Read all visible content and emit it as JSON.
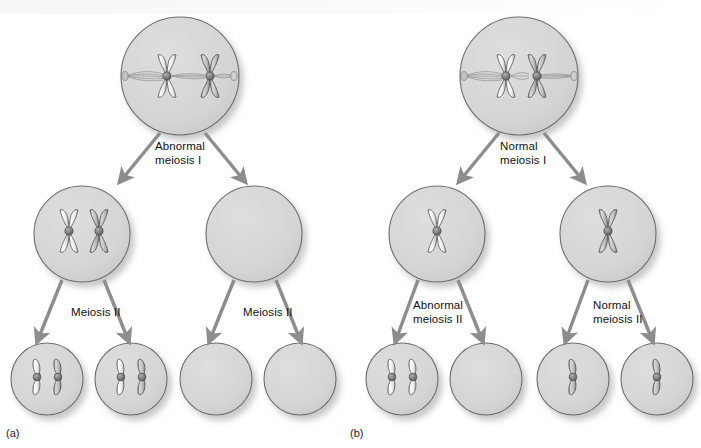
{
  "figure": {
    "title_visible": false,
    "background_color": "#ffffff",
    "cell_fill": "#d6d6d6",
    "cell_stroke": "#6e6e6e",
    "arrow_color": "#8d8d8d",
    "chromosome_light": "#f2f2f2",
    "chromosome_dark": "#bcbcbc",
    "centromere_color": "#7a7a7a",
    "label_color": "#111111"
  },
  "panels": [
    {
      "id": "a",
      "label": "(a)",
      "label_pos": {
        "x": 6,
        "y": 429
      },
      "parent_cell": {
        "name": "primary-cell-a",
        "cx": 180,
        "cy": 76,
        "r": 59,
        "chromosomes": 2,
        "chromosome_type": "replicated-pair-aligned",
        "spindle": true,
        "note_visible_text": ""
      },
      "stage1_label": {
        "text": "Abnormal\nmeiosis I",
        "line1": "Abnormal",
        "line2": "meiosis I",
        "x": 156,
        "y": 136
      },
      "secondary_cells": [
        {
          "name": "secondary-cell-a-left",
          "cx": 82,
          "cy": 234,
          "r": 48,
          "chromosomes": 2,
          "chromosome_type": "replicated"
        },
        {
          "name": "secondary-cell-a-right",
          "cx": 254,
          "cy": 234,
          "r": 48,
          "chromosomes": 0,
          "chromosome_type": "none"
        }
      ],
      "stage2_labels": [
        {
          "text": "Meiosis II",
          "x": 72,
          "y": 305
        },
        {
          "text": "Meiosis II",
          "x": 243,
          "y": 305
        }
      ],
      "gametes": [
        {
          "name": "gamete-a-1",
          "cx": 47,
          "cy": 379,
          "r": 36,
          "chromosomes": 2,
          "chromosome_type": "single"
        },
        {
          "name": "gamete-a-2",
          "cx": 131,
          "cy": 379,
          "r": 36,
          "chromosomes": 2,
          "chromosome_type": "single"
        },
        {
          "name": "gamete-a-3",
          "cx": 216,
          "cy": 379,
          "r": 36,
          "chromosomes": 0,
          "chromosome_type": "none"
        },
        {
          "name": "gamete-a-4",
          "cx": 300,
          "cy": 379,
          "r": 36,
          "chromosomes": 0,
          "chromosome_type": "none"
        }
      ]
    },
    {
      "id": "b",
      "label": "(b)",
      "label_pos": {
        "x": 350,
        "y": 429
      },
      "parent_cell": {
        "name": "primary-cell-b",
        "cx": 519,
        "cy": 76,
        "r": 59,
        "chromosomes": 2,
        "chromosome_type": "replicated-pair-aligned",
        "spindle": true,
        "note_visible_text": ""
      },
      "stage1_label": {
        "text": "Normal\nmeiosis I",
        "line1": "Normal",
        "line2": "meiosis I",
        "x": 500,
        "y": 136
      },
      "secondary_cells": [
        {
          "name": "secondary-cell-b-left",
          "cx": 437,
          "cy": 234,
          "r": 48,
          "chromosomes": 1,
          "chromosome_type": "replicated"
        },
        {
          "name": "secondary-cell-b-right",
          "cx": 608,
          "cy": 234,
          "r": 48,
          "chromosomes": 1,
          "chromosome_type": "replicated"
        }
      ],
      "stage2_labels": [
        {
          "text": "Abnormal\nmeiosis II",
          "line1": "Abnormal",
          "line2": "meiosis II",
          "x": 414,
          "y": 299
        },
        {
          "text": "Normal\nmeiosis II",
          "line1": "Normal",
          "line2": "meiosis II",
          "x": 592,
          "y": 299
        }
      ],
      "gametes": [
        {
          "name": "gamete-b-1",
          "cx": 402,
          "cy": 379,
          "r": 36,
          "chromosomes": 2,
          "chromosome_type": "single"
        },
        {
          "name": "gamete-b-2",
          "cx": 486,
          "cy": 379,
          "r": 36,
          "chromosomes": 0,
          "chromosome_type": "none"
        },
        {
          "name": "gamete-b-3",
          "cx": 573,
          "cy": 379,
          "r": 36,
          "chromosomes": 1,
          "chromosome_type": "single"
        },
        {
          "name": "gamete-b-4",
          "cx": 657,
          "cy": 379,
          "r": 36,
          "chromosomes": 1,
          "chromosome_type": "single"
        }
      ]
    }
  ],
  "arrows": [
    {
      "name": "arrow-a-meiosis1-left",
      "x1": 160,
      "y1": 133,
      "x2": 122,
      "y2": 180
    },
    {
      "name": "arrow-a-meiosis1-right",
      "x1": 205,
      "y1": 133,
      "x2": 243,
      "y2": 180
    },
    {
      "name": "arrow-a-meiosis2-left-1",
      "x1": 62,
      "y1": 279,
      "x2": 38,
      "y2": 338
    },
    {
      "name": "arrow-a-meiosis2-left-2",
      "x1": 104,
      "y1": 279,
      "x2": 128,
      "y2": 338
    },
    {
      "name": "arrow-a-meiosis2-right-1",
      "x1": 234,
      "y1": 279,
      "x2": 210,
      "y2": 338
    },
    {
      "name": "arrow-a-meiosis2-right-2",
      "x1": 276,
      "y1": 279,
      "x2": 300,
      "y2": 338
    },
    {
      "name": "arrow-b-meiosis1-left",
      "x1": 499,
      "y1": 133,
      "x2": 461,
      "y2": 180
    },
    {
      "name": "arrow-b-meiosis1-right",
      "x1": 544,
      "y1": 133,
      "x2": 582,
      "y2": 180
    },
    {
      "name": "arrow-b-meiosis2-left-1",
      "x1": 418,
      "y1": 279,
      "x2": 396,
      "y2": 338
    },
    {
      "name": "arrow-b-meiosis2-left-2",
      "x1": 458,
      "y1": 279,
      "x2": 482,
      "y2": 338
    },
    {
      "name": "arrow-b-meiosis2-right-1",
      "x1": 588,
      "y1": 279,
      "x2": 566,
      "y2": 338
    },
    {
      "name": "arrow-b-meiosis2-right-2",
      "x1": 628,
      "y1": 279,
      "x2": 652,
      "y2": 338
    }
  ]
}
